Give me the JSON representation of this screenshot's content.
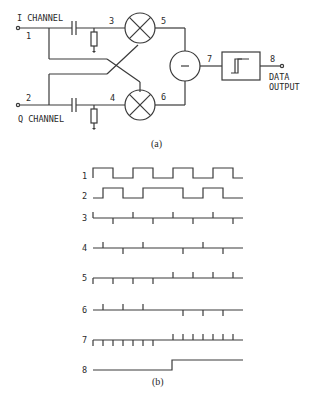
{
  "circuit": {
    "inputs": [
      {
        "id": "1",
        "label": "I CHANNEL"
      },
      {
        "id": "2",
        "label": "Q CHANNEL"
      }
    ],
    "nodes": [
      "3",
      "4",
      "5",
      "6",
      "7",
      "8"
    ],
    "mixer_symbol": "⊗",
    "subtractor_symbol": "−",
    "comparator": "hysteresis-comparator",
    "output_label_line1": "DATA",
    "output_label_line2": "OUTPUT",
    "caption": "(a)"
  },
  "waveforms": {
    "caption": "(b)",
    "rows": [
      {
        "id": "1",
        "type": "square"
      },
      {
        "id": "2",
        "type": "square (quadrature, phase reversal)"
      },
      {
        "id": "3",
        "type": "differentiated pulses of I"
      },
      {
        "id": "4",
        "type": "differentiated pulses of Q"
      },
      {
        "id": "5",
        "type": "product pulses"
      },
      {
        "id": "6",
        "type": "product pulses"
      },
      {
        "id": "7",
        "type": "difference pulses"
      },
      {
        "id": "8",
        "type": "data step output"
      }
    ]
  }
}
